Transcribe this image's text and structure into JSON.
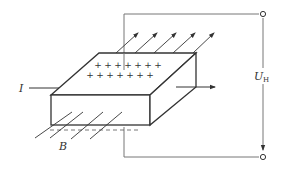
{
  "diagram": {
    "type": "hall-effect-setup",
    "labels": {
      "current": "I",
      "field": "B",
      "voltage_main": "U",
      "voltage_sub": "H"
    },
    "charges": {
      "symbol": "+",
      "rows": [
        {
          "count": 7
        },
        {
          "count": 8
        }
      ]
    },
    "colors": {
      "line": "#333333",
      "wire": "#777777",
      "background": "#ffffff"
    },
    "field_lines_count": 5,
    "terminals": [
      "top-right",
      "bottom-right"
    ]
  }
}
